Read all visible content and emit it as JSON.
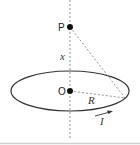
{
  "diagram": {
    "labels": {
      "point_p": "P",
      "point_o": "O",
      "distance": "x",
      "radius": "R",
      "current": "I"
    },
    "colors": {
      "stroke": "#333333",
      "dashed": "#666666",
      "bottom_rule": "#cccccc"
    }
  }
}
